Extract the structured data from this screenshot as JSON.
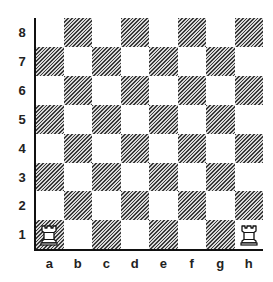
{
  "diagram": {
    "type": "chess-board",
    "ranks": [
      "8",
      "7",
      "6",
      "5",
      "4",
      "3",
      "2",
      "1"
    ],
    "files": [
      "a",
      "b",
      "c",
      "d",
      "e",
      "f",
      "g",
      "h"
    ],
    "colors": {
      "light": "#ffffff",
      "dark_hatch": "#3a3a3a",
      "border": "#111111"
    },
    "pieces": [
      {
        "square": "a1",
        "piece": "rook",
        "color": "white",
        "icon": "white-rook-icon"
      },
      {
        "square": "h1",
        "piece": "rook",
        "color": "white",
        "icon": "white-rook-icon"
      }
    ]
  }
}
